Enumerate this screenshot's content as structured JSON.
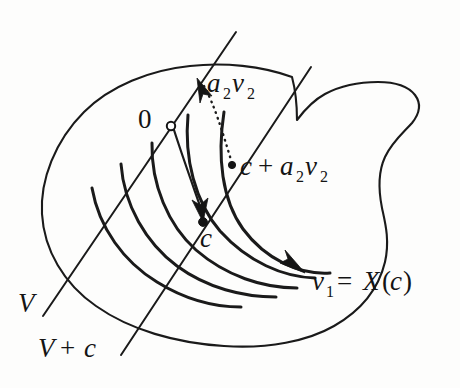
{
  "figure": {
    "background_color": "#fdfdfc",
    "ink_color": "#1a1a1a",
    "labels": {
      "origin": "0",
      "point_c": "c",
      "vector_a2v2": "a",
      "vector_a2v2_sub1": "2",
      "vector_a2v2_v": "v",
      "vector_a2v2_sub2": "2",
      "sum_c": "c",
      "sum_plus": "+",
      "sum_a": "a",
      "sum_a_sub": "2",
      "sum_v": "v",
      "sum_v_sub": "2",
      "v1_v": "v",
      "v1_sub": "1",
      "v1_eq": "=",
      "v1_X": "X",
      "v1_paren_open": "(",
      "v1_c": "c",
      "v1_paren_close": ")",
      "subspace_V": "V",
      "coset_V": "V",
      "coset_plus": "+",
      "coset_c": "c"
    },
    "full_label_text": {
      "origin": "0",
      "a2v2": "a₂v₂",
      "c_plus_a2v2": "c + a₂v₂",
      "c": "c",
      "v1_equals_Xc": "v₁ = X(c)",
      "V": "V",
      "V_plus_c": "V + c"
    },
    "markers": [
      {
        "name": "origin-marker",
        "kind": "open-circle",
        "x": 171,
        "y": 126
      },
      {
        "name": "c-plus-a2v2-marker",
        "kind": "filled-dot",
        "x": 232,
        "y": 165
      },
      {
        "name": "c-marker",
        "kind": "filled-dot",
        "x": 203,
        "y": 222
      }
    ],
    "arrows": [
      {
        "name": "a2v2-arrow",
        "description": "arrowhead on V line pointing up-right",
        "tip_x": 198,
        "tip_y": 80
      },
      {
        "name": "flow-to-c-arrow",
        "description": "curved arrow from origin down to point c",
        "tip_x": 203,
        "tip_y": 221
      },
      {
        "name": "v1-arrow",
        "description": "arrow along flow line pointing down-right toward v1 = X(c)",
        "tip_x": 303,
        "tip_y": 272
      }
    ],
    "elements": {
      "blob_name": "ambient-region-outline",
      "flow_count": 5,
      "line_V_name": "subspace-line-V",
      "line_Vc_name": "coset-line-V-plus-c",
      "dotted_name": "dotted-translation-curve"
    }
  }
}
